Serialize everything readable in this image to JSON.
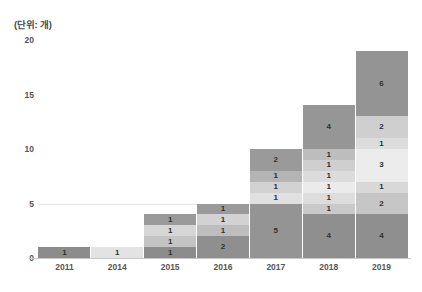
{
  "caption": "(단위: 개)",
  "chart_data": {
    "type": "bar",
    "stacked": true,
    "title": "",
    "subtitle": "",
    "xlabel": "",
    "ylabel": "",
    "unit_note": "(단위: 개)",
    "ylim": [
      0,
      20
    ],
    "yticks": [
      "0",
      "5",
      "10",
      "15",
      "20"
    ],
    "grid": "horizontal-light",
    "legend": "none",
    "categories": [
      "2011",
      "2014",
      "2015",
      "2016",
      "2017",
      "2018",
      "2019"
    ],
    "totals": [
      1,
      1,
      4,
      5,
      10,
      14,
      19
    ],
    "bars": [
      {
        "category": "2011",
        "total": 1,
        "segments": [
          {
            "value": 1,
            "label": "1",
            "color": "#8c8c8c"
          }
        ]
      },
      {
        "category": "2014",
        "total": 1,
        "segments": [
          {
            "value": 1,
            "label": "1",
            "color": "#e3e3e3"
          }
        ]
      },
      {
        "category": "2015",
        "total": 4,
        "segments": [
          {
            "value": 1,
            "label": "1",
            "color": "#8c8c8c"
          },
          {
            "value": 1,
            "label": "1",
            "color": "#c4c4c4"
          },
          {
            "value": 1,
            "label": "1",
            "color": "#d6d6d6"
          },
          {
            "value": 1,
            "label": "1",
            "color": "#9a9a9a"
          }
        ]
      },
      {
        "category": "2016",
        "total": 5,
        "segments": [
          {
            "value": 2,
            "label": "2",
            "color": "#8f8f8f"
          },
          {
            "value": 1,
            "label": "1",
            "color": "#bdbdbd"
          },
          {
            "value": 1,
            "label": "1",
            "color": "#d2d2d2"
          },
          {
            "value": 1,
            "label": "1",
            "color": "#9a9a9a"
          }
        ]
      },
      {
        "category": "2017",
        "total": 10,
        "segments": [
          {
            "value": 5,
            "label": "5",
            "color": "#949494"
          },
          {
            "value": 1,
            "label": "1",
            "color": "#e0e0e0"
          },
          {
            "value": 1,
            "label": "1",
            "color": "#d2d2d2"
          },
          {
            "value": 1,
            "label": "1",
            "color": "#b4b4b4"
          },
          {
            "value": 2,
            "label": "2",
            "color": "#9a9a9a"
          }
        ]
      },
      {
        "category": "2018",
        "total": 14,
        "segments": [
          {
            "value": 4,
            "label": "4",
            "color": "#8f8f8f"
          },
          {
            "value": 1,
            "label": "1",
            "color": "#c9c9c9"
          },
          {
            "value": 1,
            "label": "1",
            "color": "#dddddd"
          },
          {
            "value": 1,
            "label": "1",
            "color": "#ebebeb"
          },
          {
            "value": 1,
            "label": "1",
            "color": "#dcdcdc"
          },
          {
            "value": 1,
            "label": "1",
            "color": "#cfcfcf"
          },
          {
            "value": 1,
            "label": "1",
            "color": "#bdbdbd"
          },
          {
            "value": 4,
            "label": "4",
            "color": "#969696"
          }
        ]
      },
      {
        "category": "2019",
        "total": 19,
        "segments": [
          {
            "value": 4,
            "label": "4",
            "color": "#8f8f8f"
          },
          {
            "value": 2,
            "label": "2",
            "color": "#c6c6c6"
          },
          {
            "value": 1,
            "label": "1",
            "color": "#d8d8d8"
          },
          {
            "value": 3,
            "label": "3",
            "color": "#ececec"
          },
          {
            "value": 1,
            "label": "1",
            "color": "#dcdcdc"
          },
          {
            "value": 2,
            "label": "2",
            "color": "#cfcfcf"
          },
          {
            "value": 6,
            "label": "6",
            "color": "#949494"
          }
        ]
      }
    ]
  }
}
